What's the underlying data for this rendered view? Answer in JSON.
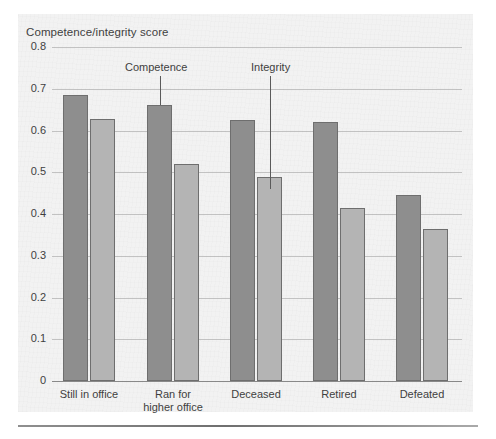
{
  "chart_data": {
    "type": "bar",
    "title": "Competence/integrity score",
    "xlabel": "",
    "ylabel": "Competence/integrity score",
    "ylim": [
      0,
      0.8
    ],
    "ytick_labels": [
      "0.8",
      "0.7",
      "0.6",
      "0.5",
      "0.4",
      "0.3",
      "0.2",
      "0.1",
      "0"
    ],
    "ytick_values": [
      0.8,
      0.7,
      0.6,
      0.5,
      0.4,
      0.3,
      0.2,
      0.1,
      0
    ],
    "grid": true,
    "legend_position": "annotations-on-bars",
    "categories": [
      "Still in office",
      "Ran for\nhigher office",
      "Deceased",
      "Retired",
      "Defeated"
    ],
    "series": [
      {
        "name": "Competence",
        "color": "#8e8e8e",
        "values": [
          0.685,
          0.66,
          0.625,
          0.62,
          0.445
        ]
      },
      {
        "name": "Integrity",
        "color": "#b4b4b4",
        "values": [
          0.627,
          0.52,
          0.488,
          0.415,
          0.365
        ]
      }
    ],
    "annotations": [
      {
        "text": "Competence",
        "points_to_series": "Competence",
        "points_to_category": "Ran for\nhigher office"
      },
      {
        "text": "Integrity",
        "points_to_series": "Integrity",
        "points_to_category": "Deceased"
      }
    ]
  },
  "colors": {
    "competence_bar": "#8e8e8e",
    "integrity_bar": "#b4b4b4",
    "bar_outline": "#6e6e6e",
    "gridline": "#9a9a9a",
    "panel_background": "#f2f2f2",
    "text": "#3f3f3f"
  }
}
